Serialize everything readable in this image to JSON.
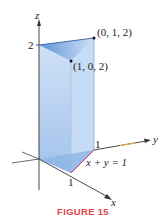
{
  "figure": {
    "caption": "FIGURE 15",
    "caption_color": "#e0454b",
    "solid_color": "#a9c8ee",
    "solid_top_color": "#7aa6e0",
    "axis_color": "#333333",
    "trace_color": "#c0306f"
  },
  "axes": {
    "x_label": "x",
    "y_label": "y",
    "z_label": "z"
  },
  "ticks": {
    "z_tick": "2",
    "x_tick": "1",
    "y_tick": "1"
  },
  "points": [
    {
      "label": "(0, 1, 2)"
    },
    {
      "label": "(1, 0, 2)"
    }
  ],
  "annotations": {
    "trace_equation": "x + y = 1"
  }
}
